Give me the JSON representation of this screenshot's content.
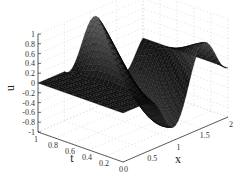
{
  "chart_data": {
    "type": "surface3d",
    "title": "",
    "xlabel": "x",
    "ylabel": "t",
    "zlabel": "u",
    "xlim": [
      0,
      2
    ],
    "ylim": [
      0,
      1
    ],
    "zlim": [
      -1,
      1
    ],
    "x_ticks": [
      "0",
      "0.5",
      "1",
      "1.5",
      "2"
    ],
    "x_tick_values": [
      0,
      0.5,
      1,
      1.5,
      2
    ],
    "t_ticks": [
      "0",
      "0.2",
      "0.4",
      "0.6",
      "0.8",
      "1"
    ],
    "t_tick_values": [
      0,
      0.2,
      0.4,
      0.6,
      0.8,
      1
    ],
    "z_ticks": [
      "-1",
      "-0.8",
      "-0.6",
      "-0.4",
      "-0.2",
      "0",
      "0.2",
      "0.4",
      "0.6",
      "0.8",
      "1"
    ],
    "z_tick_values": [
      -1,
      -0.8,
      -0.6,
      -0.4,
      -0.2,
      0,
      0.2,
      0.4,
      0.6,
      0.8,
      1
    ],
    "grid": true,
    "surface": {
      "description": "u(x,t): flat near 0 for small x; wave of amplitude ~1 traveling across x in [0.5,2]",
      "colormap": "gray",
      "x_samples": 41,
      "t_samples": 21
    }
  }
}
